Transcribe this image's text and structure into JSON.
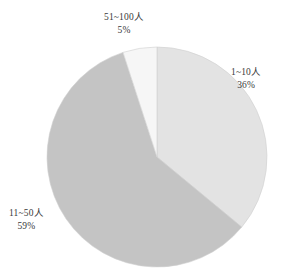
{
  "chart_data": {
    "type": "pie",
    "title": "",
    "subtitle": "",
    "xlabel": "",
    "ylabel": "",
    "legend": "none",
    "grid": false,
    "labels": [
      "1~10人",
      "11~50人",
      "51~100人"
    ],
    "values": [
      36,
      59,
      5
    ],
    "value_suffix": "%",
    "display_values": [
      "36%",
      "59%",
      "5%"
    ],
    "colors": [
      "#e3e3e3",
      "#c4c4c4",
      "#f6f6f6"
    ],
    "start_angle_deg": 0,
    "direction": "clockwise",
    "center": [
      157,
      157
    ],
    "radius": 110,
    "slices": [
      {
        "label": "1~10人",
        "value": 36,
        "display_value": "36%",
        "color": "#e3e3e3",
        "start_deg": 0,
        "end_deg": 129.6
      },
      {
        "label": "11~50人",
        "value": 59,
        "display_value": "59%",
        "color": "#c4c4c4",
        "start_deg": 129.6,
        "end_deg": 342.0
      },
      {
        "label": "51~100人",
        "value": 5,
        "display_value": "5%",
        "color": "#f6f6f6",
        "start_deg": 342.0,
        "end_deg": 360.0
      }
    ]
  },
  "figure": {
    "background": "#ffffff",
    "label_color": "#3a3a3a",
    "outline_color": "#d0d0d0"
  }
}
